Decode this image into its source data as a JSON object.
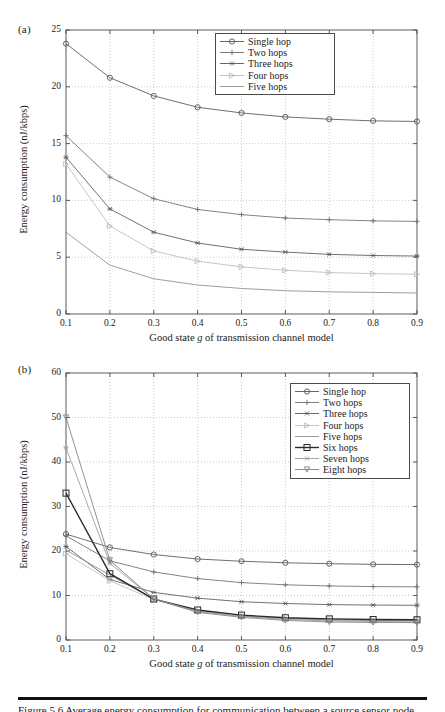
{
  "figure": {
    "panel_a_tag": "(a)",
    "panel_b_tag": "(b)",
    "rule_present": true,
    "caption_partial": "Figure 5.6  Average energy consumption for communication between a source sensor node and a sink."
  },
  "axis_titles": {
    "y": "Energy consumption (nJ/kbps)",
    "x_prefix": "Good state ",
    "x_italic": "g",
    "x_suffix": " of transmission channel model"
  },
  "colors": {
    "axis": "#4a4a4a",
    "grid": "#b4b4b4",
    "text": "#1a1a1a",
    "single_hop": "#555555",
    "two_hops": "#6e6e6e",
    "three_hops": "#585858",
    "four_hops": "#bdbdbd",
    "five_hops": "#8e8e8e",
    "six_hops": "#2a2a2a",
    "seven_hops": "#9a9a9a",
    "eight_hops": "#808080"
  },
  "chart_data": [
    {
      "id": "panel-a",
      "type": "line",
      "title": "(a)",
      "xlabel": "Good state g of transmission channel model",
      "ylabel": "Energy consumption (nJ/kbps)",
      "x": [
        0.1,
        0.2,
        0.3,
        0.4,
        0.5,
        0.6,
        0.7,
        0.8,
        0.9
      ],
      "xticklabels": [
        "0.1",
        "0.2",
        "0.3",
        "0.4",
        "0.5",
        "0.6",
        "0.7",
        "0.8",
        "0.9"
      ],
      "yticklabels": [
        "0",
        "5",
        "10",
        "15",
        "20",
        "25"
      ],
      "xlim": [
        0.1,
        0.9
      ],
      "ylim": [
        0,
        25
      ],
      "yticks": [
        0,
        5,
        10,
        15,
        20,
        25
      ],
      "grid": true,
      "legend_position": "upper right",
      "series": [
        {
          "name": "Single hop",
          "marker": "circle",
          "color": "#555555",
          "values": [
            23.8,
            20.8,
            19.2,
            18.2,
            17.7,
            17.35,
            17.15,
            17.0,
            16.95
          ]
        },
        {
          "name": "Two hops",
          "marker": "plus",
          "color": "#6e6e6e",
          "values": [
            15.7,
            12.05,
            10.15,
            9.2,
            8.75,
            8.45,
            8.3,
            8.2,
            8.15
          ]
        },
        {
          "name": "Three hops",
          "marker": "asterisk",
          "color": "#585858",
          "values": [
            13.8,
            9.25,
            7.2,
            6.25,
            5.7,
            5.45,
            5.25,
            5.15,
            5.1
          ]
        },
        {
          "name": "Four hops",
          "marker": "triangle-right",
          "color": "#bdbdbd",
          "values": [
            13.2,
            7.75,
            5.55,
            4.65,
            4.15,
            3.85,
            3.65,
            3.55,
            3.5
          ]
        },
        {
          "name": "Five hops",
          "marker": "none",
          "color": "#8e8e8e",
          "values": [
            7.2,
            4.3,
            3.1,
            2.55,
            2.25,
            2.05,
            1.95,
            1.9,
            1.85
          ]
        }
      ]
    },
    {
      "id": "panel-b",
      "type": "line",
      "title": "(b)",
      "xlabel": "Good state g of transmission channel model",
      "ylabel": "Energy consumption (nJ/kbps)",
      "x": [
        0.1,
        0.2,
        0.3,
        0.4,
        0.5,
        0.6,
        0.7,
        0.8,
        0.9
      ],
      "xticklabels": [
        "0.1",
        "0.2",
        "0.3",
        "0.4",
        "0.5",
        "0.6",
        "0.7",
        "0.8",
        "0.9"
      ],
      "yticklabels": [
        "0",
        "10",
        "20",
        "30",
        "40",
        "50",
        "60"
      ],
      "xlim": [
        0.1,
        0.9
      ],
      "ylim": [
        0,
        60
      ],
      "yticks": [
        0,
        10,
        20,
        30,
        40,
        50,
        60
      ],
      "grid": true,
      "legend_position": "upper right",
      "series": [
        {
          "name": "Single hop",
          "marker": "circle",
          "color": "#555555",
          "values": [
            23.8,
            20.8,
            19.2,
            18.2,
            17.7,
            17.35,
            17.15,
            17.0,
            16.95
          ]
        },
        {
          "name": "Two hops",
          "marker": "plus",
          "color": "#6e6e6e",
          "values": [
            23.4,
            17.8,
            15.3,
            13.8,
            12.9,
            12.4,
            12.15,
            12.0,
            11.95
          ]
        },
        {
          "name": "Three hops",
          "marker": "asterisk",
          "color": "#585858",
          "values": [
            21.0,
            13.6,
            10.7,
            9.4,
            8.6,
            8.2,
            7.95,
            7.85,
            7.8
          ]
        },
        {
          "name": "Four hops",
          "marker": "triangle-right",
          "color": "#bdbdbd",
          "values": [
            19.4,
            13.3,
            9.1,
            6.6,
            5.5,
            4.9,
            4.6,
            4.5,
            4.45
          ]
        },
        {
          "name": "Five hops",
          "marker": "none",
          "color": "#8e8e8e",
          "values": [
            20.2,
            14.6,
            9.2,
            6.5,
            5.4,
            4.8,
            4.5,
            4.4,
            4.35
          ]
        },
        {
          "name": "Six hops",
          "marker": "square",
          "color": "#2a2a2a",
          "values": [
            33.0,
            14.9,
            9.2,
            6.75,
            5.6,
            5.0,
            4.75,
            4.6,
            4.55
          ]
        },
        {
          "name": "Seven hops",
          "marker": "asterisk",
          "color": "#9a9a9a",
          "values": [
            43.2,
            17.2,
            9.3,
            6.4,
            5.3,
            4.6,
            4.3,
            4.15,
            4.1
          ]
        },
        {
          "name": "Eight hops",
          "marker": "triangle-down",
          "color": "#808080",
          "values": [
            50.0,
            17.9,
            9.2,
            6.2,
            5.1,
            4.4,
            4.05,
            3.95,
            3.9
          ]
        }
      ]
    }
  ]
}
